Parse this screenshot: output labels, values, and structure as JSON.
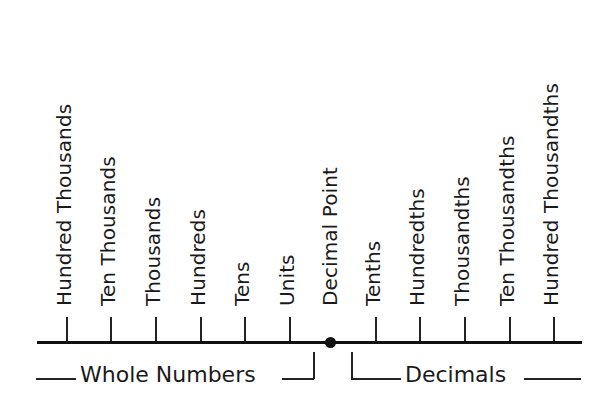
{
  "diagram": {
    "whole_places": [
      {
        "label": "Hundred Thousands",
        "x": 66
      },
      {
        "label": "Ten Thousands",
        "x": 110
      },
      {
        "label": "Thousands",
        "x": 155
      },
      {
        "label": "Hundreds",
        "x": 200
      },
      {
        "label": "Tens",
        "x": 244
      },
      {
        "label": "Units",
        "x": 289
      }
    ],
    "decimal_point": {
      "label": "Decimal Point",
      "x": 330
    },
    "decimal_places": [
      {
        "label": "Tenths",
        "x": 375
      },
      {
        "label": "Hundredths",
        "x": 419
      },
      {
        "label": "Thousandths",
        "x": 464
      },
      {
        "label": "Ten Thousandths",
        "x": 509
      },
      {
        "label": "Hundred Thousandths",
        "x": 553
      }
    ],
    "groups": {
      "whole": "Whole Numbers",
      "decimal": "Decimals"
    },
    "colors": {
      "line": "#111111",
      "text": "#1a1a1a",
      "background": "#ffffff"
    }
  }
}
